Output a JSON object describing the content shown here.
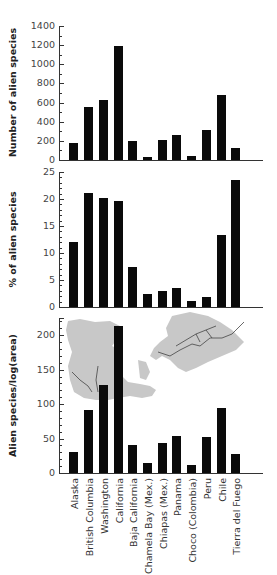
{
  "chart_data": [
    {
      "type": "bar",
      "title": "",
      "xlabel": "",
      "ylabel": "Number of alien species",
      "ylim": [
        0,
        1400
      ],
      "yticks": [
        0,
        200,
        400,
        600,
        800,
        1000,
        1200,
        1400
      ],
      "categories": [
        "Alaska",
        "British Columbia",
        "Washington",
        "California",
        "Baja California",
        "Chamela Bay (Mex.)",
        "Chiapas (Mex.)",
        "Panama",
        "Choco (Colombia)",
        "Peru",
        "Chile",
        "Tierra del Fuego"
      ],
      "values": [
        180,
        550,
        630,
        1190,
        200,
        35,
        210,
        260,
        45,
        310,
        680,
        125
      ],
      "grid": false
    },
    {
      "type": "bar",
      "title": "",
      "xlabel": "",
      "ylabel": "% of alien species",
      "ylim": [
        0,
        25
      ],
      "yticks": [
        0,
        5,
        10,
        15,
        20,
        25
      ],
      "categories": [
        "Alaska",
        "British Columbia",
        "Washington",
        "California",
        "Baja California",
        "Chamela Bay (Mex.)",
        "Chiapas (Mex.)",
        "Panama",
        "Choco (Colombia)",
        "Peru",
        "Chile",
        "Tierra del Fuego"
      ],
      "values": [
        12.0,
        21.2,
        20.2,
        19.6,
        7.5,
        2.4,
        2.9,
        3.5,
        1.2,
        1.8,
        13.3,
        23.6
      ],
      "grid": false
    },
    {
      "type": "bar",
      "title": "",
      "xlabel": "",
      "ylabel": "Alien species/log(area)",
      "ylim": [
        0,
        225
      ],
      "yticks": [
        0,
        50,
        100,
        150,
        200
      ],
      "categories": [
        "Alaska",
        "British Columbia",
        "Washington",
        "California",
        "Baja California",
        "Chamela Bay (Mex.)",
        "Chiapas (Mex.)",
        "Panama",
        "Choco (Colombia)",
        "Peru",
        "Chile",
        "Tierra del Fuego"
      ],
      "values": [
        30,
        92,
        128,
        214,
        40,
        14,
        43,
        54,
        11,
        52,
        95,
        27
      ],
      "grid": false,
      "annotations": [
        "Inset map of the Americas (gray) with Pacific coast routes"
      ]
    }
  ],
  "labels": {
    "categories": [
      "Alaska",
      "British Columbia",
      "Washington",
      "California",
      "Baja California",
      "Chamela Bay (Mex.)",
      "Chiapas (Mex.)",
      "Panama",
      "Choco (Colombia)",
      "Peru",
      "Chile",
      "Tierra del Fuego"
    ]
  },
  "colors": {
    "bar": "#0a0a0a",
    "axis": "#333333",
    "map": "#c8c8c8",
    "map_lines": "#444444"
  }
}
